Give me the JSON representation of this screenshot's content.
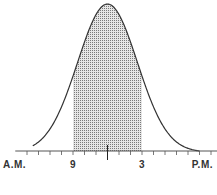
{
  "chart_data": {
    "type": "area",
    "title": "",
    "x_labels": [
      "A.M.",
      "9",
      "3",
      "P.M."
    ],
    "x_label_positions_hours": [
      null,
      9,
      15,
      null
    ],
    "curve": "normal",
    "mean_hour": 12,
    "shaded_range_hours": [
      9,
      15
    ],
    "center_marker_hour": 12,
    "tick_interval_hours": 1,
    "axis_range_hours": [
      4.5,
      21.5
    ],
    "curve_range_hours": [
      5.5,
      20
    ],
    "colors": {
      "curve": "#333333",
      "shade": "#888888",
      "axis": "#555555",
      "text": "#333333"
    }
  }
}
